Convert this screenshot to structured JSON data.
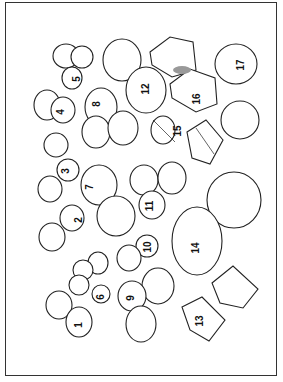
{
  "figure": {
    "items": [
      {
        "id": "1",
        "label": "1",
        "x": 18,
        "y": 320
      },
      {
        "id": "2",
        "label": "2",
        "x": 77,
        "y": 218
      },
      {
        "id": "3",
        "label": "3",
        "x": 66,
        "y": 171
      },
      {
        "id": "4",
        "label": "4",
        "x": 60,
        "y": 108
      },
      {
        "id": "5",
        "label": "5",
        "x": 78,
        "y": 56
      },
      {
        "id": "6",
        "label": "6",
        "x": 99,
        "y": 294
      },
      {
        "id": "7",
        "label": "7",
        "x": 90,
        "y": 185
      },
      {
        "id": "8",
        "label": "8",
        "x": 100,
        "y": 102
      },
      {
        "id": "9",
        "label": "9",
        "x": 131,
        "y": 294
      },
      {
        "id": "10",
        "label": "10",
        "x": 143,
        "y": 241
      },
      {
        "id": "11",
        "label": "11",
        "x": 148,
        "y": 204
      },
      {
        "id": "12",
        "label": "12",
        "x": 141,
        "y": 86
      },
      {
        "id": "13",
        "label": "13",
        "x": 194,
        "y": 315
      },
      {
        "id": "14",
        "label": "14",
        "x": 194,
        "y": 243
      },
      {
        "id": "15",
        "label": "15",
        "x": 173,
        "y": 125
      },
      {
        "id": "16",
        "label": "16",
        "x": 192,
        "y": 97
      },
      {
        "id": "17",
        "label": "17",
        "x": 239,
        "y": 62
      }
    ]
  }
}
